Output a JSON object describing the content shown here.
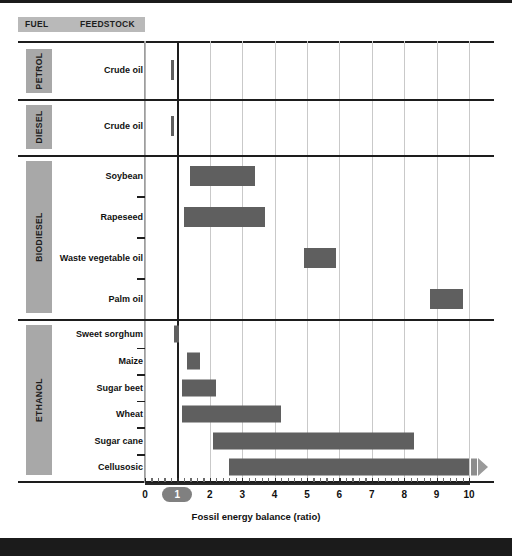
{
  "header": {
    "fuel_label": "FUEL",
    "feedstock_label": "FEEDSTOCK"
  },
  "axis": {
    "title": "Fossil energy balance (ratio)",
    "ticks": [
      "0",
      "1",
      "2",
      "3",
      "4",
      "5",
      "6",
      "7",
      "8",
      "9",
      "10"
    ],
    "highlight_tick": "1"
  },
  "groups": [
    {
      "name": "PETROL"
    },
    {
      "name": "DIESEL"
    },
    {
      "name": "BIODIESEL"
    },
    {
      "name": "ETHANOL"
    }
  ],
  "rows": [
    {
      "feedstock": "Crude oil"
    },
    {
      "feedstock": "Crude oil"
    },
    {
      "feedstock": "Soybean"
    },
    {
      "feedstock": "Rapeseed"
    },
    {
      "feedstock": "Waste vegetable oil"
    },
    {
      "feedstock": "Palm oil"
    },
    {
      "feedstock": "Sweet sorghum"
    },
    {
      "feedstock": "Maize"
    },
    {
      "feedstock": "Sugar beet"
    },
    {
      "feedstock": "Wheat"
    },
    {
      "feedstock": "Sugar cane"
    },
    {
      "feedstock": "Cellusosic"
    }
  ],
  "colors": {
    "bar": "#5f5f5f",
    "group_tag": "#a8a8a8",
    "header_strip": "#b9b9b9",
    "gridline": "#c9c9c9",
    "axis": "#1d1d1d",
    "highlight_pill": "#808080"
  },
  "chart_data": {
    "type": "bar",
    "orientation": "horizontal",
    "style": "range-bars",
    "title": "",
    "xlabel": "Fossil energy balance (ratio)",
    "ylabel": "",
    "xlim": [
      0,
      10
    ],
    "grid": true,
    "legend": "none",
    "reference_line": 1,
    "categories": [
      "Crude oil",
      "Crude oil",
      "Soybean",
      "Rapeseed",
      "Waste vegetable oil",
      "Palm oil",
      "Sweet sorghum",
      "Maize",
      "Sugar beet",
      "Wheat",
      "Sugar cane",
      "Cellusosic"
    ],
    "groups": [
      "PETROL",
      "DIESEL",
      "BIODIESEL",
      "BIODIESEL",
      "BIODIESEL",
      "BIODIESEL",
      "ETHANOL",
      "ETHANOL",
      "ETHANOL",
      "ETHANOL",
      "ETHANOL",
      "ETHANOL"
    ],
    "ranges": [
      {
        "label": "Crude oil",
        "group": "PETROL",
        "low": 0.8,
        "high": 0.88,
        "open_ended": false
      },
      {
        "label": "Crude oil",
        "group": "DIESEL",
        "low": 0.8,
        "high": 0.88,
        "open_ended": false
      },
      {
        "label": "Soybean",
        "group": "BIODIESEL",
        "low": 1.4,
        "high": 3.4,
        "open_ended": false
      },
      {
        "label": "Rapeseed",
        "group": "BIODIESEL",
        "low": 1.2,
        "high": 3.7,
        "open_ended": false
      },
      {
        "label": "Waste vegetable oil",
        "group": "BIODIESEL",
        "low": 4.9,
        "high": 5.9,
        "open_ended": false
      },
      {
        "label": "Palm oil",
        "group": "BIODIESEL",
        "low": 8.8,
        "high": 9.8,
        "open_ended": false
      },
      {
        "label": "Sweet sorghum",
        "group": "ETHANOL",
        "low": 0.9,
        "high": 1.05,
        "open_ended": false
      },
      {
        "label": "Maize",
        "group": "ETHANOL",
        "low": 1.3,
        "high": 1.7,
        "open_ended": false
      },
      {
        "label": "Sugar beet",
        "group": "ETHANOL",
        "low": 1.15,
        "high": 2.2,
        "open_ended": false
      },
      {
        "label": "Wheat",
        "group": "ETHANOL",
        "low": 1.15,
        "high": 4.2,
        "open_ended": false
      },
      {
        "label": "Sugar cane",
        "group": "ETHANOL",
        "low": 2.1,
        "high": 8.3,
        "open_ended": false
      },
      {
        "label": "Cellusosic",
        "group": "ETHANOL",
        "low": 2.6,
        "high": 10.0,
        "open_ended": true
      }
    ]
  }
}
